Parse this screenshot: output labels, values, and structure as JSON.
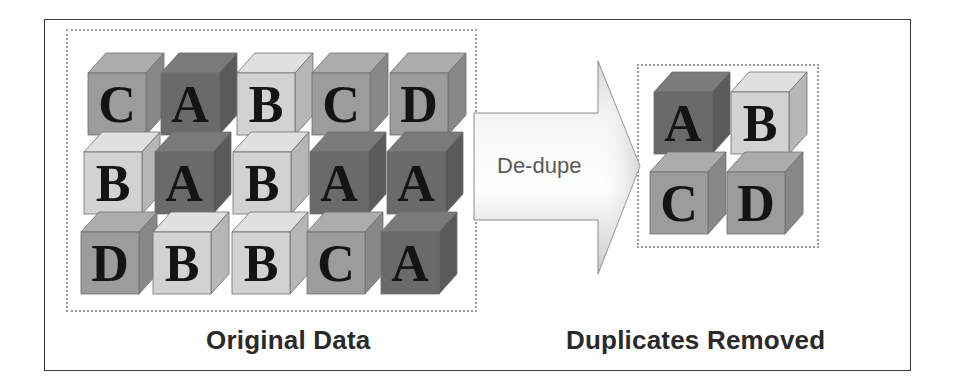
{
  "diagram": {
    "colors": {
      "frame_border": "#3a3a3a",
      "dash_border": "#9a9a9a",
      "cube_A": {
        "front": "#6a6a6a",
        "top": "#7a7a7a",
        "side": "#5a5a5a"
      },
      "cube_B": {
        "front": "#d2d2d2",
        "top": "#e0e0e0",
        "side": "#b6b6b6"
      },
      "cube_C": {
        "front": "#9c9c9c",
        "top": "#acacac",
        "side": "#888888"
      },
      "cube_D": {
        "front": "#9c9c9c",
        "top": "#acacac",
        "side": "#888888"
      }
    },
    "original": {
      "label": "Original Data",
      "rows": [
        [
          "C",
          "A",
          "B",
          "C",
          "D"
        ],
        [
          "B",
          "A",
          "B",
          "A",
          "A"
        ],
        [
          "D",
          "B",
          "B",
          "C",
          "A"
        ]
      ]
    },
    "process": {
      "label": "De-dupe",
      "icon": "right-arrow-icon"
    },
    "result": {
      "label": "Duplicates Removed",
      "rows": [
        [
          "A",
          "B"
        ],
        [
          "C",
          "D"
        ]
      ]
    }
  }
}
